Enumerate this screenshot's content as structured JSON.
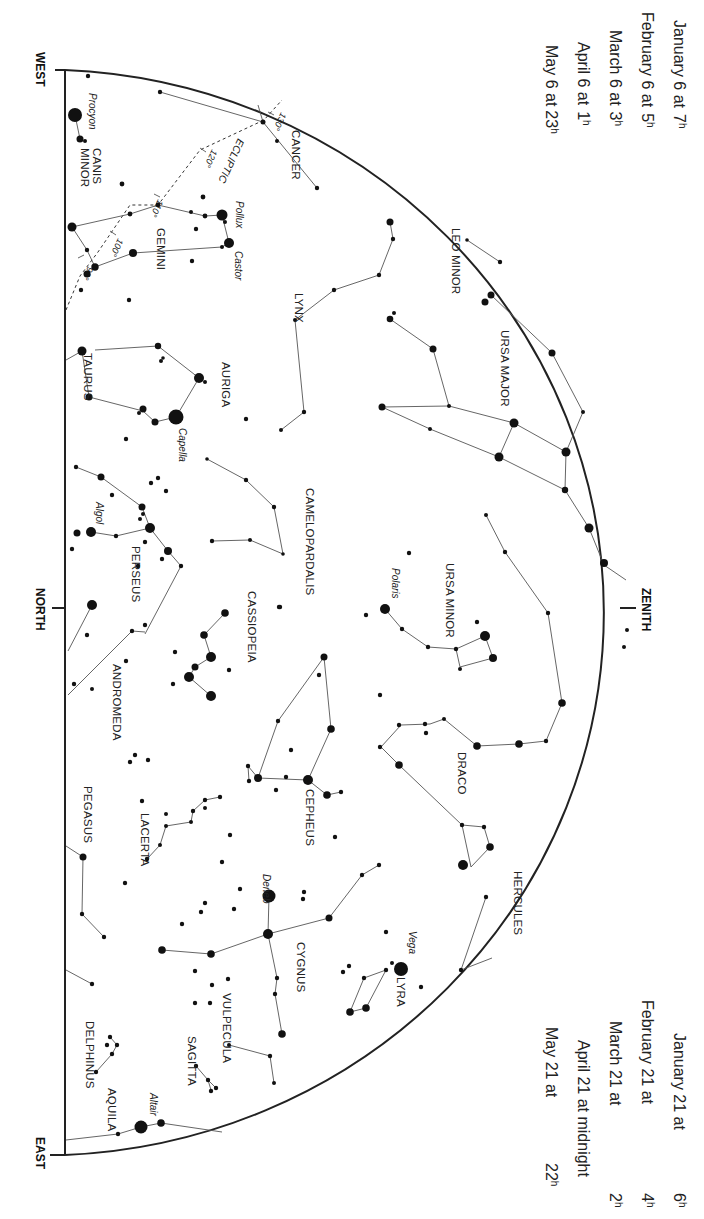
{
  "directions": {
    "west": "WEST",
    "north": "NORTH",
    "east": "EAST",
    "zenith": "ZENITH"
  },
  "time_table_top": [
    {
      "text": "January 6 at",
      "hour": "7",
      "unit": "h"
    },
    {
      "text": "February 6 at",
      "hour": "5",
      "unit": "h"
    },
    {
      "text": "March 6 at",
      "hour": "3",
      "unit": "h"
    },
    {
      "text": "April 6 at",
      "hour": "1",
      "unit": "h"
    },
    {
      "text": "May 6 at",
      "hour": "23",
      "unit": "h"
    }
  ],
  "time_table_bottom": [
    {
      "text": "January 21 at",
      "hour": "6",
      "unit": "h"
    },
    {
      "text": "February 21 at",
      "hour": "4",
      "unit": "h"
    },
    {
      "text": "March 21 at",
      "hour": "2",
      "unit": "h"
    },
    {
      "text": "April 21 at midnight",
      "hour": "",
      "unit": ""
    },
    {
      "text": "May 21 at",
      "hour": "22",
      "unit": "h"
    }
  ],
  "ecliptic": {
    "label": "ECLIPTIC",
    "ticks": [
      "90°",
      "100°",
      "110°",
      "120°",
      "130°"
    ]
  },
  "constellations": [
    {
      "name": "CANIS MINOR",
      "lines": [
        "CANIS",
        "MINOR"
      ]
    },
    {
      "name": "CANCER",
      "lines": [
        "CANCER"
      ]
    },
    {
      "name": "GEMINI",
      "lines": [
        "GEMINI"
      ]
    },
    {
      "name": "LEO MINOR",
      "lines": [
        "LEO MINOR"
      ]
    },
    {
      "name": "LYNX",
      "lines": [
        "LYNX"
      ]
    },
    {
      "name": "URSA MAJOR",
      "lines": [
        "URSA MAJOR"
      ]
    },
    {
      "name": "TAURUS",
      "lines": [
        "TAURUS"
      ]
    },
    {
      "name": "AURIGA",
      "lines": [
        "AURIGA"
      ]
    },
    {
      "name": "CAMELOPARDALIS",
      "lines": [
        "CAMELOPARDALIS"
      ]
    },
    {
      "name": "PERSEUS",
      "lines": [
        "PERSEUS"
      ]
    },
    {
      "name": "URSA MINOR",
      "lines": [
        "URSA MINOR"
      ]
    },
    {
      "name": "CASSIOPEIA",
      "lines": [
        "CASSIOPEIA"
      ]
    },
    {
      "name": "ANDROMEDA",
      "lines": [
        "ANDROMEDA"
      ]
    },
    {
      "name": "DRACO",
      "lines": [
        "DRACO"
      ]
    },
    {
      "name": "CEPHEUS",
      "lines": [
        "CEPHEUS"
      ]
    },
    {
      "name": "PEGASUS",
      "lines": [
        "PEGASUS"
      ]
    },
    {
      "name": "LACERTA",
      "lines": [
        "LACERTA"
      ]
    },
    {
      "name": "HERCULES",
      "lines": [
        "HERCULES"
      ]
    },
    {
      "name": "CYGNUS",
      "lines": [
        "CYGNUS"
      ]
    },
    {
      "name": "LYRA",
      "lines": [
        "LYRA"
      ]
    },
    {
      "name": "VULPECULA",
      "lines": [
        "VULPECULA"
      ]
    },
    {
      "name": "SAGITTA",
      "lines": [
        "SAGITTA"
      ]
    },
    {
      "name": "DELPHINUS",
      "lines": [
        "DELPHINUS"
      ]
    },
    {
      "name": "AQUILA",
      "lines": [
        "AQUILA"
      ]
    }
  ],
  "named_stars": [
    "Procyon",
    "Pollux",
    "Castor",
    "Capella",
    "Algol",
    "Polaris",
    "Deneb",
    "Vega",
    "Altair"
  ],
  "map_geometry": {
    "horizon_x": 65,
    "west_y": 70,
    "east_y": 1155,
    "zenith_x": 628,
    "zenith_y": 608
  },
  "constellation_label_positions": [
    {
      "key": "CANIS MINOR",
      "x": 93,
      "y": 148,
      "lines": [
        "CANIS",
        "MINOR"
      ]
    },
    {
      "key": "CANCER",
      "x": 283,
      "y": 130,
      "lines": [
        "CANCER"
      ]
    },
    {
      "key": "GEMINI",
      "x": 148,
      "y": 228,
      "lines": [
        "GEMINI"
      ]
    },
    {
      "key": "LEO MINOR",
      "x": 444,
      "y": 228,
      "lines": [
        "LEO MINOR"
      ]
    },
    {
      "key": "LYNX",
      "x": 287,
      "y": 293,
      "lines": [
        "LYNX"
      ]
    },
    {
      "key": "URSA MAJOR",
      "x": 492,
      "y": 330,
      "lines": [
        "URSA MAJOR"
      ]
    },
    {
      "key": "TAURUS",
      "x": 75,
      "y": 353,
      "lines": [
        "TAURUS"
      ]
    },
    {
      "key": "AURIGA",
      "x": 213,
      "y": 362,
      "lines": [
        "AURIGA"
      ]
    },
    {
      "key": "CAMELOPARDALIS",
      "x": 298,
      "y": 490,
      "lines": [
        "CAMELOPARDALIS"
      ]
    },
    {
      "key": "PERSEUS",
      "x": 124,
      "y": 548,
      "lines": [
        "PERSEUS"
      ]
    },
    {
      "key": "URSA MINOR",
      "x": 437,
      "y": 598,
      "lines": [
        "URSA MINOR"
      ]
    },
    {
      "key": "CASSIOPEIA",
      "x": 240,
      "y": 625,
      "lines": [
        "CASSIOPEIA"
      ]
    },
    {
      "key": "ANDROMEDA",
      "x": 105,
      "y": 705,
      "lines": [
        "ANDROMEDA"
      ]
    },
    {
      "key": "DRACO",
      "x": 449,
      "y": 765,
      "lines": [
        "DRACO"
      ]
    },
    {
      "key": "CEPHEUS",
      "x": 297,
      "y": 815,
      "lines": [
        "CEPHEUS"
      ]
    },
    {
      "key": "PEGASUS",
      "x": 75,
      "y": 823,
      "lines": [
        "PEGASUS"
      ]
    },
    {
      "key": "LACERTA",
      "x": 134,
      "y": 838,
      "lines": [
        "LACERTA"
      ]
    },
    {
      "key": "HERCULES",
      "x": 505,
      "y": 852,
      "lines": [
        "HERCULES"
      ]
    },
    {
      "key": "CYGNUS",
      "x": 289,
      "y": 957,
      "lines": [
        "CYGNUS"
      ]
    },
    {
      "key": "LYRA",
      "x": 389,
      "y": 986,
      "lines": [
        "LYRA"
      ]
    },
    {
      "key": "VULPECULA",
      "x": 214,
      "y": 1024,
      "lines": [
        "VULPECULA"
      ]
    },
    {
      "key": "SAGITTA",
      "x": 180,
      "y": 1059,
      "lines": [
        "SAGITTA"
      ]
    },
    {
      "key": "DELPHINUS",
      "x": 77,
      "y": 1052,
      "lines": [
        "DELPHINUS"
      ]
    },
    {
      "key": "AQUILA",
      "x": 99,
      "y": 1108,
      "lines": [
        "AQUILA"
      ]
    }
  ]
}
